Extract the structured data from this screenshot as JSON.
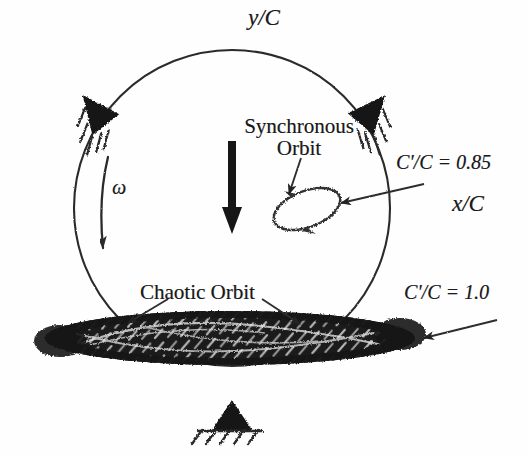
{
  "figure": {
    "background_color": "#fefefe",
    "ink_color": "#1a1a1a"
  },
  "axes": {
    "y_label": "y/C",
    "x_label": "x/C",
    "origin": {
      "x": 232,
      "y": 208
    },
    "x_axis_start": {
      "x": 20,
      "y": 208
    },
    "x_axis_end": {
      "x": 450,
      "y": 208
    },
    "y_axis_start": {
      "x": 232,
      "y": 430
    },
    "y_axis_end": {
      "x": 232,
      "y": 18
    }
  },
  "clearance_circle": {
    "center_x": 232,
    "center_y": 208,
    "radius": 158,
    "stroke_width": 2,
    "label": "clearance-circle"
  },
  "annotations": {
    "omega_symbol": "ω",
    "synchronous_orbit_label": "Synchronous\nOrbit",
    "synchronous_orbit_line_1": "Synchronous",
    "synchronous_orbit_line_2": "Orbit",
    "chaotic_orbit_label": "Chaotic Orbit",
    "eccentricity_ratio_small": "C'/C = 0.85",
    "eccentricity_ratio_large": "C'/C = 1.0"
  },
  "supports": [
    {
      "name": "support-upper-left",
      "x": 95,
      "y": 110,
      "rotation": -35,
      "hatch_side": "left"
    },
    {
      "name": "support-upper-right",
      "x": 372,
      "y": 110,
      "rotation": 38,
      "hatch_side": "right"
    },
    {
      "name": "support-bottom",
      "x": 232,
      "y": 413,
      "rotation": 0,
      "hatch_side": "bottom"
    }
  ],
  "synchronous_orbit": {
    "center_x": 307,
    "center_y": 209,
    "rx": 34,
    "ry": 17,
    "tilt_deg": -22,
    "direction": "counter-clockwise"
  },
  "chaotic_orbit": {
    "center_x": 230,
    "center_y": 338,
    "rx": 185,
    "ry": 27,
    "fill": "#1c1c1c",
    "description": "dense flattened chaotic attractor band"
  },
  "load_arrow": {
    "name": "static-load-arrow",
    "from_y": 140,
    "to_y": 228,
    "x": 232,
    "color": "#111111"
  },
  "leader_arrows": [
    {
      "name": "leader-synchronous-orbit",
      "x1": 300,
      "y1": 157,
      "x2": 288,
      "y2": 196
    },
    {
      "name": "leader-ratio-085",
      "x1": 420,
      "y1": 183,
      "x2": 337,
      "y2": 203
    },
    {
      "name": "leader-chaotic-left",
      "x1": 170,
      "y1": 300,
      "x2": 128,
      "y2": 324
    },
    {
      "name": "leader-chaotic-right",
      "x1": 260,
      "y1": 300,
      "x2": 298,
      "y2": 325
    },
    {
      "name": "leader-ratio-10",
      "x1": 490,
      "y1": 316,
      "x2": 420,
      "y2": 335
    }
  ]
}
